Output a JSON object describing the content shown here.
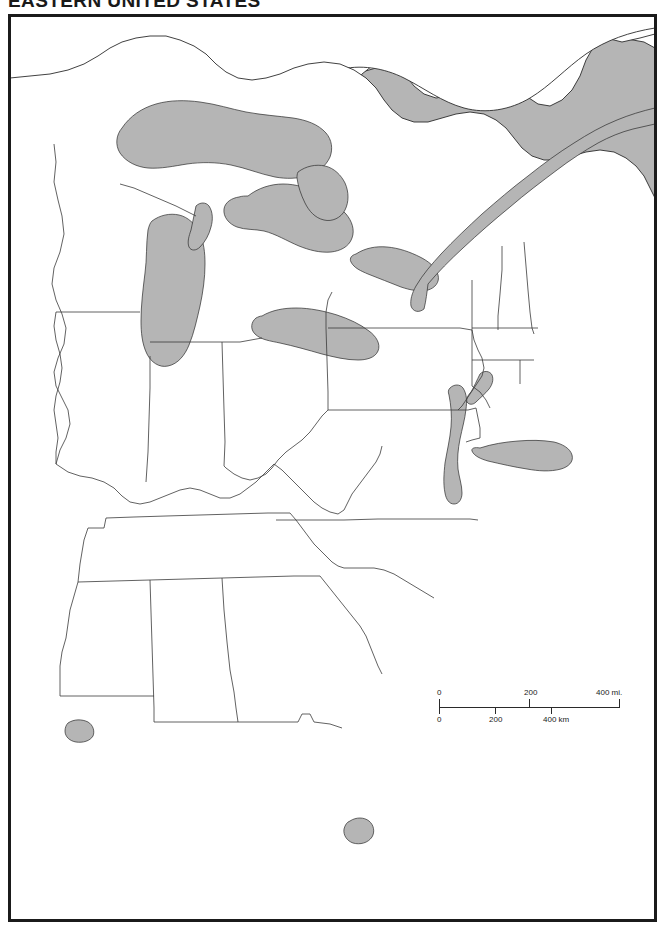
{
  "document": {
    "title": "EASTERN UNITED STATES",
    "kind": "blank-outline-map"
  },
  "map": {
    "region": "Eastern United States",
    "projection_note": "",
    "colors": {
      "water": "#b5b5b5",
      "land": "#ffffff",
      "border_line": "#333333",
      "coastline": "#2b2b2b",
      "frame": "#1b1b1b",
      "title_text": "#1a1a1a"
    },
    "features": {
      "water_bodies": [
        "Lake Superior",
        "Lake Michigan",
        "Lake Huron",
        "Lake Erie",
        "Lake Ontario",
        "Atlantic Ocean",
        "Gulf of Mexico",
        "Chesapeake Bay",
        "Lake Okeechobee",
        "Lake Pontchartrain",
        "Long Island Sound"
      ],
      "has_state_boundaries": true,
      "has_labels": false
    }
  },
  "scale_bar": {
    "miles": {
      "unit_label": "400 mi.",
      "ticks": [
        "0",
        "200",
        "400"
      ]
    },
    "kilometers": {
      "unit_label": "400 km",
      "ticks": [
        "0",
        "200",
        "400"
      ]
    },
    "miles_zero": "0",
    "miles_mid": "200",
    "miles_end": "400 mi.",
    "km_zero": "0",
    "km_mid": "200",
    "km_end": "400 km"
  }
}
